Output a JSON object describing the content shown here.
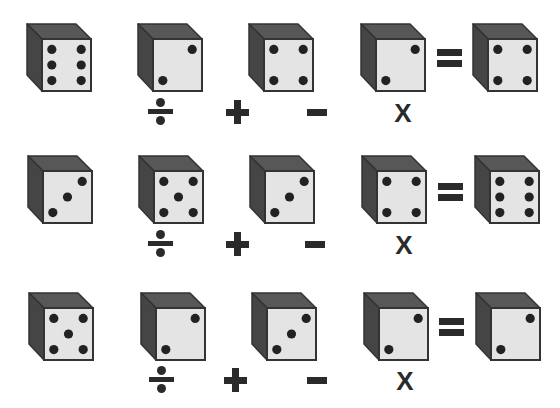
{
  "puzzle": {
    "colors": {
      "face": "#e4e4e4",
      "top": "#575757",
      "side": "#454545",
      "pip": "#222222",
      "outline": "#333333",
      "operator": "#2a2a2a"
    },
    "operators": {
      "divide": "÷",
      "plus": "+",
      "minus": "−",
      "times": "X",
      "equals": "="
    },
    "rows": [
      {
        "dice": [
          6,
          2,
          4,
          2
        ],
        "result": 4
      },
      {
        "dice": [
          3,
          5,
          3,
          4
        ],
        "result": 6
      },
      {
        "dice": [
          5,
          2,
          3,
          2
        ],
        "result": 2
      }
    ]
  }
}
